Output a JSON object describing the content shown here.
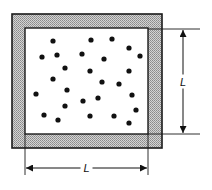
{
  "figure": {
    "colors": {
      "wall_fill": "#b8b8b8",
      "line": "#1a1a1a",
      "particle": "#111111",
      "interior": "#ffffff"
    },
    "outer_box": {
      "x": 12,
      "y": 14,
      "w": 150,
      "h": 134
    },
    "inner_box": {
      "x": 25,
      "y": 28,
      "w": 123,
      "h": 106
    },
    "dimensions": {
      "horizontal": {
        "label": "L",
        "x1": 26,
        "x2": 147,
        "y": 168
      },
      "vertical": {
        "label": "L",
        "x": 183,
        "y1": 30,
        "y2": 133
      }
    },
    "particles": [
      [
        53,
        41
      ],
      [
        91,
        40
      ],
      [
        112,
        39
      ],
      [
        129,
        48
      ],
      [
        140,
        56
      ],
      [
        42,
        57
      ],
      [
        57,
        55
      ],
      [
        82,
        54
      ],
      [
        104,
        59
      ],
      [
        65,
        68
      ],
      [
        90,
        71
      ],
      [
        129,
        71
      ],
      [
        53,
        79
      ],
      [
        102,
        82
      ],
      [
        119,
        84
      ],
      [
        36,
        94
      ],
      [
        67,
        90
      ],
      [
        98,
        98
      ],
      [
        83,
        101
      ],
      [
        132,
        95
      ],
      [
        65,
        106
      ],
      [
        136,
        110
      ],
      [
        44,
        115
      ],
      [
        58,
        120
      ],
      [
        90,
        116
      ],
      [
        114,
        116
      ],
      [
        129,
        123
      ]
    ],
    "particle_radius": 2.6
  }
}
